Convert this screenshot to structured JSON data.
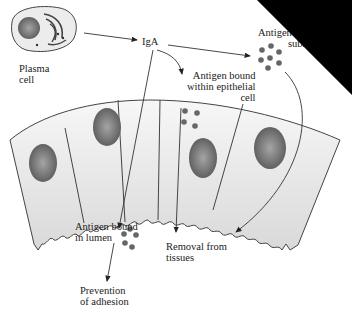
{
  "diagram": {
    "nodes": {
      "plasma_cell": {
        "line1": "Plasma",
        "line2": "cell"
      },
      "iga": {
        "label": "IgA"
      },
      "antigen_submucosa": {
        "line1": "Antigen bound",
        "line2": "submucosa"
      },
      "antigen_epithelial": {
        "line1": "Antigen bound",
        "line2": "within epithelial",
        "line3": "cell"
      },
      "antigen_lumen": {
        "line1": "Antigen bound",
        "line2": "in lumen"
      },
      "removal": {
        "line1": "Removal from",
        "line2": "tissues"
      },
      "prevention": {
        "line1": "Prevention",
        "line2": "of adhesion"
      }
    },
    "edges": [
      {
        "from": "plasma_cell",
        "to": "iga"
      },
      {
        "from": "iga",
        "to": "antigen_submucosa"
      },
      {
        "from": "iga",
        "to": "antigen_epithelial"
      },
      {
        "from": "iga",
        "to": "antigen_lumen"
      },
      {
        "from": "antigen_epithelial",
        "to": "removal"
      },
      {
        "from": "antigen_submucosa",
        "to": "removal"
      },
      {
        "from": "antigen_lumen",
        "to": "prevention"
      }
    ],
    "colors": {
      "cell_fill": "#e6e6e6",
      "nucleus": "#7a7a7a",
      "antigen": "#666666",
      "line": "#333333"
    }
  }
}
